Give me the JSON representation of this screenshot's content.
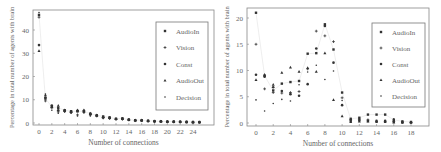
{
  "chart_data": [
    {
      "type": "scatter",
      "title": "",
      "xlabel": "Number of connections",
      "ylabel": "Percentage in total number of agents with brain",
      "xlim": [
        -1,
        27
      ],
      "ylim": [
        -1,
        48
      ],
      "xticks": [
        0,
        2,
        4,
        6,
        8,
        10,
        12,
        14,
        16,
        18,
        20,
        22,
        24
      ],
      "yticks": [
        0,
        10,
        20,
        30,
        40
      ],
      "grid": false,
      "legend_position": "upper right",
      "legend": [
        "AudioIn",
        "Vision",
        "Const",
        "AudioOut",
        "Decision"
      ],
      "x": [
        0,
        1,
        2,
        3,
        4,
        5,
        6,
        7,
        8,
        9,
        10,
        11,
        12,
        13,
        14,
        15,
        16,
        17,
        18,
        19,
        20,
        21,
        22,
        23,
        24,
        25
      ],
      "series": [
        {
          "name": "AudioIn",
          "marker": "square",
          "values": [
            46.5,
            10.5,
            7.0,
            6.5,
            5.5,
            5.0,
            5.0,
            5.0,
            4.0,
            3.3,
            2.8,
            2.4,
            1.8,
            2.0,
            1.4,
            1.2,
            1.2,
            0.9,
            0.8,
            0.7,
            0.6,
            0.6,
            0.5,
            0.5,
            0.4,
            0.4
          ]
        },
        {
          "name": "Vision",
          "marker": "plus",
          "values": [
            45.5,
            9.5,
            6.5,
            4.8,
            5.0,
            4.5,
            3.5,
            4.6,
            3.5,
            3.0,
            2.2,
            2.0,
            1.6,
            1.6,
            1.3,
            1.0,
            1.0,
            0.8,
            0.7,
            0.6,
            0.6,
            0.5,
            0.5,
            0.4,
            0.4,
            0.3
          ]
        },
        {
          "name": "Const",
          "marker": "circle",
          "values": [
            33.5,
            11.0,
            7.5,
            5.5,
            5.2,
            5.0,
            5.2,
            5.2,
            3.8,
            3.2,
            2.5,
            2.2,
            1.7,
            1.8,
            1.5,
            1.1,
            1.1,
            0.9,
            0.7,
            0.7,
            0.5,
            0.5,
            0.5,
            0.4,
            0.3,
            0.3
          ]
        },
        {
          "name": "AudioOut",
          "marker": "triangle",
          "values": [
            31.0,
            12.0,
            7.0,
            7.5,
            5.6,
            4.8,
            5.5,
            5.5,
            4.2,
            3.4,
            2.6,
            2.3,
            1.8,
            1.9,
            1.5,
            1.2,
            1.2,
            0.9,
            0.8,
            0.7,
            0.6,
            0.6,
            0.5,
            0.4,
            0.4,
            0.4
          ]
        },
        {
          "name": "Decision",
          "marker": "dot",
          "values": [
            47.5,
            12.5,
            5.5,
            4.2,
            4.8,
            4.2,
            3.0,
            4.4,
            3.0,
            3.0,
            2.0,
            1.8,
            1.5,
            1.5,
            1.2,
            1.0,
            0.9,
            0.7,
            0.6,
            0.6,
            0.5,
            0.5,
            0.4,
            0.3,
            0.3,
            0.3
          ]
        }
      ]
    },
    {
      "type": "scatter",
      "title": "",
      "xlabel": "Number of connections",
      "ylabel": "Percentage in total number of agents with brain",
      "xlim": [
        -1,
        20
      ],
      "ylim": [
        -0.5,
        22
      ],
      "xticks": [
        0,
        2,
        4,
        6,
        8,
        10,
        12,
        14,
        16,
        18
      ],
      "yticks": [
        0,
        5,
        10,
        15,
        20
      ],
      "grid": false,
      "legend_position": "upper right",
      "legend": [
        "AudioIn",
        "Vision",
        "Const",
        "AudioOut",
        "Decision"
      ],
      "x": [
        0,
        1,
        2,
        3,
        4,
        5,
        6,
        7,
        8,
        9,
        10,
        11,
        12,
        13,
        14,
        15,
        16,
        17,
        18
      ],
      "series": [
        {
          "name": "AudioIn",
          "marker": "square",
          "values": [
            21.0,
            9.0,
            6.2,
            7.5,
            7.8,
            8.0,
            13.2,
            13.3,
            18.8,
            14.0,
            5.8,
            0.8,
            1.0,
            1.6,
            1.6,
            1.6,
            0.6,
            0.3,
            0.2
          ]
        },
        {
          "name": "Vision",
          "marker": "plus",
          "values": [
            15.0,
            6.5,
            5.8,
            5.7,
            5.8,
            6.0,
            10.3,
            17.5,
            16.6,
            15.5,
            4.8,
            0.6,
            0.7,
            0.6,
            0.3,
            0.3,
            0.3,
            0.2,
            0.1
          ]
        },
        {
          "name": "Const",
          "marker": "circle",
          "values": [
            9.2,
            8.8,
            6.8,
            6.1,
            5.5,
            5.2,
            7.4,
            14.2,
            18.5,
            11.5,
            3.4,
            0.4,
            0.5,
            0.4,
            0.4,
            0.4,
            0.2,
            0.1,
            0.1
          ]
        },
        {
          "name": "AudioOut",
          "marker": "triangle",
          "values": [
            8.2,
            9.2,
            7.3,
            9.6,
            10.6,
            9.8,
            10.5,
            9.8,
            13.3,
            4.4,
            1.3,
            0.2,
            0.3,
            0.3,
            0.2,
            0.2,
            0.1,
            0.1,
            0.1
          ]
        },
        {
          "name": "Decision",
          "marker": "dot",
          "values": [
            4.4,
            2.3,
            3.7,
            4.5,
            4.2,
            7.3,
            9.7,
            11.0,
            8.3,
            9.9,
            4.3,
            0.5,
            0.8,
            0.3,
            0.3,
            0.3,
            0.8,
            0.1,
            0.1
          ]
        }
      ]
    }
  ]
}
